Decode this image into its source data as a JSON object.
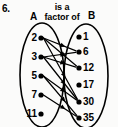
{
  "question_number": "6.",
  "relation": {
    "line1": "is a",
    "line2": "factor of"
  },
  "sets": {
    "left": {
      "label": "A",
      "items": [
        {
          "value": "2",
          "x": 41,
          "y": 38
        },
        {
          "value": "3",
          "x": 41,
          "y": 57
        },
        {
          "value": "5",
          "x": 41,
          "y": 76
        },
        {
          "value": "7",
          "x": 41,
          "y": 95
        },
        {
          "value": "11",
          "x": 41,
          "y": 114
        }
      ],
      "ellipse": {
        "cx": 42,
        "cy": 75,
        "rx": 22,
        "ry": 52
      }
    },
    "right": {
      "label": "B",
      "items": [
        {
          "value": "1",
          "x": 79,
          "y": 37
        },
        {
          "value": "6",
          "x": 79,
          "y": 52
        },
        {
          "value": "12",
          "x": 79,
          "y": 68
        },
        {
          "value": "17",
          "x": 79,
          "y": 85
        },
        {
          "value": "30",
          "x": 79,
          "y": 102
        },
        {
          "value": "35",
          "x": 79,
          "y": 118
        }
      ],
      "ellipse": {
        "cx": 86,
        "cy": 76,
        "rx": 22,
        "ry": 52
      }
    }
  },
  "edges": [
    {
      "from": "2",
      "to": "6"
    },
    {
      "from": "2",
      "to": "12"
    },
    {
      "from": "2",
      "to": "30"
    },
    {
      "from": "3",
      "to": "6"
    },
    {
      "from": "3",
      "to": "12"
    },
    {
      "from": "3",
      "to": "30"
    },
    {
      "from": "5",
      "to": "30"
    },
    {
      "from": "5",
      "to": "35"
    },
    {
      "from": "7",
      "to": "35"
    }
  ],
  "style": {
    "ink": "#000000",
    "background": "#fbfbfa"
  }
}
